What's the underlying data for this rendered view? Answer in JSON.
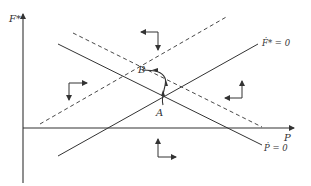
{
  "diagram": {
    "type": "phase-diagram",
    "axes": {
      "x_label": "P",
      "y_label": "F*"
    },
    "curves": [
      {
        "id": "fdot-zero",
        "label": "Ḟ* = 0",
        "style": "solid",
        "slope": "positive"
      },
      {
        "id": "pdot-zero",
        "label": "Ṗ = 0",
        "style": "solid",
        "slope": "negative"
      },
      {
        "id": "fdot-zero-shifted",
        "label": "",
        "style": "dashed",
        "slope": "positive"
      },
      {
        "id": "pdot-zero-shifted",
        "label": "",
        "style": "dashed",
        "slope": "negative"
      }
    ],
    "points": [
      {
        "id": "A",
        "label": "A"
      },
      {
        "id": "B",
        "label": "B"
      }
    ],
    "path": {
      "from": "A",
      "to": "B",
      "style": "solid-with-arrows"
    },
    "direction_arrows": [
      {
        "region": "top",
        "horizontal": "left",
        "vertical": "down"
      },
      {
        "region": "left",
        "horizontal": "right",
        "vertical": "down"
      },
      {
        "region": "right",
        "horizontal": "left",
        "vertical": "up"
      },
      {
        "region": "bottom",
        "horizontal": "right",
        "vertical": "up"
      }
    ],
    "colors": {
      "line": "#333333",
      "background": "#ffffff"
    }
  }
}
